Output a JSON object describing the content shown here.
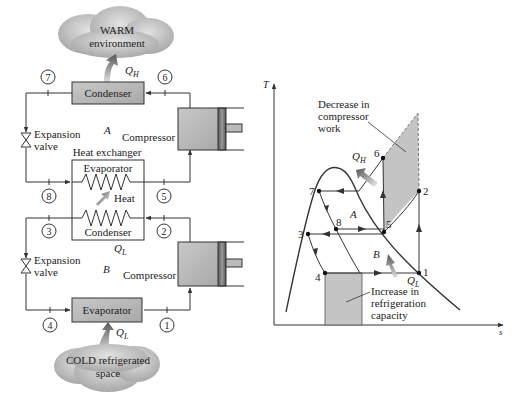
{
  "figure": {
    "schematic": {
      "warm_cloud": {
        "line1": "WARM",
        "line2": "environment"
      },
      "cold_cloud": {
        "line1": "COLD refrigerated",
        "line2": "space"
      },
      "condenser_top": "Condenser",
      "evaporator_bottom": "Evaporator",
      "heat_exchanger": {
        "title": "Heat exchanger",
        "evaporator": "Evaporator",
        "condenser": "Condenser",
        "heat": "Heat"
      },
      "expansion_valve_top": {
        "line1": "Expansion",
        "line2": "valve"
      },
      "expansion_valve_bottom": {
        "line1": "Expansion",
        "line2": "valve"
      },
      "compressor_top": "Compressor",
      "compressor_bottom": "Compressor",
      "cycle_a": "A",
      "cycle_b": "B",
      "q_h": {
        "main": "Q",
        "sub": "H"
      },
      "q_l_mid": {
        "main": "Q",
        "sub": "L"
      },
      "q_l_bottom": {
        "main": "Q",
        "sub": "L"
      },
      "states": [
        "1",
        "2",
        "3",
        "4",
        "5",
        "6",
        "7",
        "8"
      ]
    },
    "ts_diagram": {
      "y_axis": "T",
      "x_axis": "s",
      "annotation_top": {
        "line1": "Decrease in",
        "line2": "compressor",
        "line3": "work"
      },
      "annotation_bottom": {
        "line1": "Increase in",
        "line2": "refrigeration",
        "line3": "capacity"
      },
      "cycle_a": "A",
      "cycle_b": "B",
      "q_h": {
        "main": "Q",
        "sub": "H"
      },
      "q_l": {
        "main": "Q",
        "sub": "L"
      },
      "points": {
        "p1": "1",
        "p2": "2",
        "p3": "3",
        "p4": "4",
        "p5": "5",
        "p6": "6",
        "p7": "7",
        "p8": "8"
      }
    },
    "colors": {
      "component_fill": "#b8b8b8",
      "shade_fill": "#c4c4c4",
      "cloud_fill": "#c9c9c9",
      "arrow_fill": "#777777",
      "line": "#333333"
    }
  }
}
